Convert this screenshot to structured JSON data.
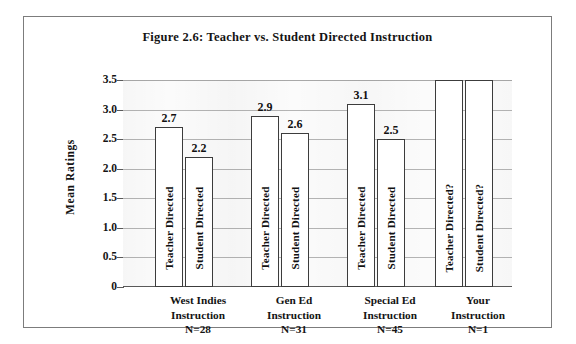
{
  "figure": {
    "title": "Figure 2.6: Teacher vs. Student Directed Instruction",
    "y_axis_title": "Mean Ratings",
    "border_color": "#7c7c7c",
    "bar_fill": "#ffffff",
    "bar_border": "#3c3c3c",
    "gridline_color": "#b4b4b4",
    "plot_background": "#fbfbfb"
  },
  "chart_data": {
    "type": "bar",
    "title": "Figure 2.6: Teacher vs. Student Directed Instruction",
    "xlabel": "",
    "ylabel": "Mean Ratings",
    "ylim": [
      0,
      3.5
    ],
    "grid": true,
    "legend": "none",
    "y_ticks": [
      "0",
      "0.5",
      "1.0",
      "1.5",
      "2.0",
      "2.5",
      "3.0",
      "3.5"
    ],
    "y_tick_values": [
      0,
      0.5,
      1.0,
      1.5,
      2.0,
      2.5,
      3.0,
      3.5
    ],
    "categories": [
      "West Indies Instruction",
      "Gen Ed Instruction",
      "Special Ed Instruction",
      "Your Instruction"
    ],
    "category_lines": [
      [
        "West Indies",
        "Instruction",
        "N=28"
      ],
      [
        "Gen Ed",
        "Instruction",
        "N=31"
      ],
      [
        "Special Ed",
        "Instruction",
        "N=45"
      ],
      [
        "Your",
        "Instruction",
        "N=1"
      ]
    ],
    "sample_sizes": [
      "N=28",
      "N=31",
      "N=45",
      "N=1"
    ],
    "series": [
      {
        "name": "Teacher Directed",
        "values": [
          2.7,
          2.9,
          3.1,
          3.5
        ],
        "value_labels": [
          "2.7",
          "2.9",
          "3.1",
          ""
        ],
        "bar_labels": [
          "Teacher Directed",
          "Teacher Directed",
          "Teacher Directed",
          "Teacher Directed?"
        ]
      },
      {
        "name": "Student Directed",
        "values": [
          2.2,
          2.6,
          2.5,
          3.5
        ],
        "value_labels": [
          "2.2",
          "2.6",
          "2.5",
          ""
        ],
        "bar_labels": [
          "Student Directed",
          "Student Directed",
          "Student Directed",
          "Student Directed?"
        ]
      }
    ]
  },
  "bars": [
    {
      "label": "Teacher Directed",
      "value_label": "2.7",
      "value": 2.7,
      "left": 32,
      "width": 28
    },
    {
      "label": "Student Directed",
      "value_label": "2.2",
      "value": 2.2,
      "left": 62,
      "width": 28
    },
    {
      "label": "Teacher Directed",
      "value_label": "2.9",
      "value": 2.9,
      "left": 128,
      "width": 28
    },
    {
      "label": "Student Directed",
      "value_label": "2.6",
      "value": 2.6,
      "left": 158,
      "width": 28
    },
    {
      "label": "Teacher Directed",
      "value_label": "3.1",
      "value": 3.1,
      "left": 224,
      "width": 28
    },
    {
      "label": "Student Directed",
      "value_label": "2.5",
      "value": 2.5,
      "left": 254,
      "width": 28
    },
    {
      "label": "Teacher Directed?",
      "value_label": "",
      "value": 3.5,
      "left": 312,
      "width": 28
    },
    {
      "label": "Student Directed?",
      "value_label": "",
      "value": 3.5,
      "left": 342,
      "width": 28
    }
  ]
}
